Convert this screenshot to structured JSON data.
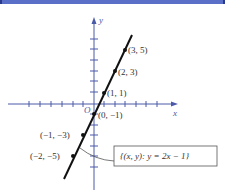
{
  "header": {
    "bar_color": "#5a6fc8"
  },
  "diagram": {
    "axes": {
      "x_label": "x",
      "y_label": "y",
      "origin_label": "O",
      "axis_color": "#4a5aa8"
    },
    "points": [
      {
        "label": "(3, 5)",
        "x": 3,
        "y": 5
      },
      {
        "label": "(2, 3)",
        "x": 2,
        "y": 3
      },
      {
        "label": "(1, 1)",
        "x": 1,
        "y": 1
      },
      {
        "label": "(0, −1)",
        "x": 0,
        "y": -1
      },
      {
        "label": "(−1, −3)",
        "x": -1,
        "y": -3
      },
      {
        "label": "(−2, −5)",
        "x": -2,
        "y": -5
      }
    ],
    "line_equation": "y = 2x − 1",
    "callout_label": "{(x, y):  y = 2x − 1}",
    "line_color": "#111111"
  }
}
